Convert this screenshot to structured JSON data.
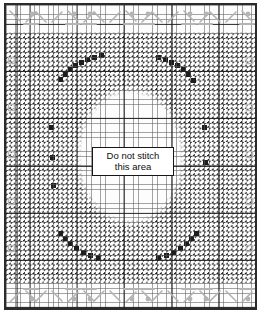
{
  "chart": {
    "kind": "cross-stitch-pattern-chart",
    "canvas": {
      "width": 263,
      "height": 318
    },
    "frame": {
      "border_color": "#2b2b2b",
      "background_color": "#fdfdfd",
      "border_width_px": 2
    },
    "grid": {
      "cell_size_px": 4.72,
      "fine_line_color": "#5a5a5a",
      "major_line_color": "#191919",
      "major_every_cells": 10,
      "columns": 52,
      "rows": 63
    },
    "stitch_fill": {
      "symbol_name": "diagonal-slash-stitch",
      "color": "#1d1d1d",
      "direction": "backslash",
      "description": "solid diagonal half-stitch marks filling every charted square"
    },
    "reserved_area": {
      "shape": "oval",
      "fill": "#ffffff",
      "label_line_1": "Do not stitch",
      "label_line_2": "this area",
      "label_border_color": "#161616",
      "label_background": "#ffffff"
    },
    "border_band": {
      "symbol_color": "#b4b4b4",
      "repeat_count": 7,
      "symbols": [
        {
          "name": "zigzag-chevron-stitch",
          "glyph": "zigzag"
        },
        {
          "name": "dot-bead-symbol",
          "glyph": "dot"
        },
        {
          "name": "horizontal-dash-stitch",
          "glyph": "dash"
        }
      ],
      "rows": [
        "top",
        "bottom"
      ]
    },
    "edge_markers": {
      "name": "ruler-tick-marker",
      "color": "#b9b9b9",
      "sides": [
        "left",
        "right"
      ],
      "count_per_side": 6
    }
  }
}
